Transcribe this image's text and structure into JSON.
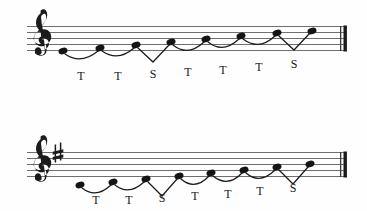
{
  "figure": {
    "kind": "music-notation",
    "background": "#fefefe",
    "ink_color": "#1b1b1b",
    "staff_line_color": "#6e6e6e",
    "systems": [
      {
        "id": "system-1",
        "clef": "treble-clef",
        "key_signature": [],
        "key_signature_label": "",
        "barline": "thick-final-barline",
        "notes": [
          {
            "index": 0,
            "degree": 1,
            "x": 63,
            "y": 51
          },
          {
            "index": 1,
            "degree": 2,
            "x": 100,
            "y": 48
          },
          {
            "index": 2,
            "degree": 3,
            "x": 136,
            "y": 45
          },
          {
            "index": 3,
            "degree": 4,
            "x": 171,
            "y": 42
          },
          {
            "index": 4,
            "degree": 5,
            "x": 206,
            "y": 39
          },
          {
            "index": 5,
            "degree": 6,
            "x": 241,
            "y": 36
          },
          {
            "index": 6,
            "degree": 7,
            "x": 277,
            "y": 33
          },
          {
            "index": 7,
            "degree": 8,
            "x": 312,
            "y": 31
          }
        ],
        "intervals": [
          {
            "label": "T",
            "x": 81,
            "shape": "slur"
          },
          {
            "label": "T",
            "x": 118,
            "shape": "slur"
          },
          {
            "label": "S",
            "x": 153,
            "shape": "vee"
          },
          {
            "label": "T",
            "x": 188,
            "shape": "slur"
          },
          {
            "label": "T",
            "x": 223,
            "shape": "slur"
          },
          {
            "label": "T",
            "x": 259,
            "shape": "slur"
          },
          {
            "label": "S",
            "x": 294,
            "shape": "vee"
          }
        ]
      },
      {
        "id": "system-2",
        "clef": "treble-clef",
        "key_signature": [
          "sharp-sign"
        ],
        "key_signature_label": "♯",
        "barline": "thick-final-barline",
        "notes": [
          {
            "index": 0,
            "degree": 1,
            "x": 80,
            "y": 185
          },
          {
            "index": 1,
            "degree": 2,
            "x": 113,
            "y": 182
          },
          {
            "index": 2,
            "degree": 3,
            "x": 146,
            "y": 179
          },
          {
            "index": 3,
            "degree": 4,
            "x": 179,
            "y": 176
          },
          {
            "index": 4,
            "degree": 5,
            "x": 211,
            "y": 173
          },
          {
            "index": 5,
            "degree": 6,
            "x": 244,
            "y": 170
          },
          {
            "index": 6,
            "degree": 7,
            "x": 277,
            "y": 167
          },
          {
            "index": 7,
            "degree": 8,
            "x": 310,
            "y": 164
          }
        ],
        "intervals": [
          {
            "label": "T",
            "x": 96,
            "shape": "slur"
          },
          {
            "label": "T",
            "x": 129,
            "shape": "slur"
          },
          {
            "label": "S",
            "x": 162,
            "shape": "vee"
          },
          {
            "label": "T",
            "x": 195,
            "shape": "slur"
          },
          {
            "label": "T",
            "x": 228,
            "shape": "slur"
          },
          {
            "label": "T",
            "x": 260,
            "shape": "slur"
          },
          {
            "label": "S",
            "x": 293,
            "shape": "vee"
          }
        ]
      }
    ]
  }
}
